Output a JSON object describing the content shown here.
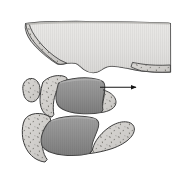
{
  "figure": {
    "title": "Type III",
    "caption_text": "Type III",
    "background_color": "#ffffff",
    "width_px": 185,
    "height_px": 189,
    "title_color": "#3d3d3d"
  },
  "palette": {
    "background": "#ffffff",
    "outline": "#3a3a3a",
    "cancellous_fill": "#d2d0cd",
    "cancellous_speckle": "#7e7d79",
    "cortical_light_fill": "#e3e2e0",
    "cortical_light_shade": "#c9c8c5",
    "vertebral_body_fill": "#8d8d8d",
    "vertebral_body_shade": "#6f6f6f",
    "vertebral_body_highlight": "#a6a6a6",
    "arrow_color": "#1a1a1a",
    "title_color": "#3d3d3d"
  },
  "annotations": {
    "arrow": {
      "name": "displacement-arrow",
      "direction": "right",
      "start_x": 100,
      "start_y": 87,
      "end_x": 139,
      "end_y": 87,
      "meaning": "anterior displacement of fractured fragment"
    }
  },
  "structures": [
    {
      "id": "upper-fragment",
      "label": "Upper vertebral body fragment",
      "fill": "#e3e2e0",
      "cancellous_regions": 2,
      "note": "large superior fragment, hatched cortical surface with cancellous bone at left and right inferior margins"
    },
    {
      "id": "middle-vertebra-body",
      "label": "Middle vertebral body",
      "fill": "#8d8d8d",
      "note": "darker shaded vertebral body, displaced"
    },
    {
      "id": "middle-posterior-elements",
      "label": "Middle posterior elements",
      "fill": "#d2d0cd",
      "note": "speckled cancellous lamina and spinous process"
    },
    {
      "id": "lower-vertebra-body",
      "label": "Lower vertebral body",
      "fill": "#8d8d8d",
      "note": "darker shaded vertebral body below"
    },
    {
      "id": "lower-posterior-elements",
      "label": "Lower posterior elements",
      "fill": "#d2d0cd",
      "note": "speckled cancellous lamina / spinous process extending inferiorly right"
    },
    {
      "id": "facet-fragment",
      "label": "Superior articular fragment",
      "fill": "#d2d0cd",
      "note": "small detached speckled oval at upper left of middle level"
    }
  ]
}
